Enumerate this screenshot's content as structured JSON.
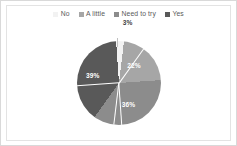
{
  "chart_data": {
    "type": "pie",
    "title": "",
    "categories": [
      "No",
      "A little",
      "Need to try",
      "Yes"
    ],
    "values": [
      3,
      22,
      36,
      39
    ],
    "value_labels": [
      "3%",
      "22%",
      "36%",
      "39%"
    ],
    "unit": "%",
    "legend_position": "top",
    "grid": false,
    "colors": [
      "#f2f2f2",
      "#a6a6a6",
      "#8c8c8c",
      "#595959"
    ],
    "slice_start_angle_deg": -4,
    "label_positions": [
      "outside",
      "inside",
      "inside",
      "inside"
    ]
  },
  "legend": {
    "items": [
      {
        "label": "No",
        "color": "#f2f2f2"
      },
      {
        "label": "A little",
        "color": "#a6a6a6"
      },
      {
        "label": "Need to try",
        "color": "#8c8c8c"
      },
      {
        "label": "Yes",
        "color": "#595959"
      }
    ]
  },
  "labels": {
    "no": "3%",
    "a_little": "22%",
    "need_to_try": "36%",
    "yes": "39%"
  },
  "style": {
    "background": "#ffffff",
    "frame_color": "#e3e3e3",
    "outer_border_color": "#d9d9d9",
    "label_text_color": "#ffffff",
    "outside_label_color": "#3f3f3f",
    "legend_text_color": "#5a5a5a"
  }
}
